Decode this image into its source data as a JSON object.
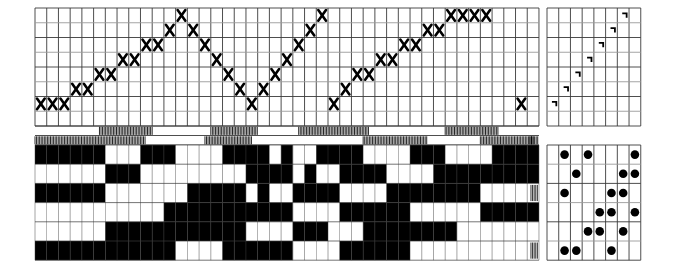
{
  "document": {
    "type": "weaving-draft",
    "title": "Weaving draft (threading, tie-up, treadling and drawdown)",
    "background_color": "#ffffff",
    "grid_line_color": "#3a3a3a",
    "grid_line_color_light": "#9a9a9a",
    "mark_color": "#000000"
  },
  "geometry": {
    "threading_origin_x": 35,
    "threading_origin_y": 8,
    "cell_w": 11.72,
    "threading_cell_h": 14.75,
    "threading_cols": 43,
    "threading_rows": 8,
    "tieup_origin_x": 547,
    "tieup_cols": 8,
    "hatch_band_y": 126,
    "hatch_band_rows": 2,
    "hatch_band_h": 9.5,
    "drawdown_origin_y": 145,
    "drawdown_rows": 6,
    "drawdown_cell_h": 19.2,
    "pedal_origin_x": 547,
    "pedal_cols": 8
  },
  "threading": {
    "label": "threading-draft",
    "symbol": "X",
    "note": "shaft index counted from bottom row = 0",
    "columns": [
      {
        "col": 0,
        "row_from_bottom": 1
      },
      {
        "col": 1,
        "row_from_bottom": 1
      },
      {
        "col": 2,
        "row_from_bottom": 1
      },
      {
        "col": 3,
        "row_from_bottom": 2
      },
      {
        "col": 4,
        "row_from_bottom": 2
      },
      {
        "col": 5,
        "row_from_bottom": 3
      },
      {
        "col": 6,
        "row_from_bottom": 3
      },
      {
        "col": 7,
        "row_from_bottom": 4
      },
      {
        "col": 8,
        "row_from_bottom": 4
      },
      {
        "col": 9,
        "row_from_bottom": 5
      },
      {
        "col": 10,
        "row_from_bottom": 5
      },
      {
        "col": 11,
        "row_from_bottom": 6
      },
      {
        "col": 12,
        "row_from_bottom": 7
      },
      {
        "col": 13,
        "row_from_bottom": 6
      },
      {
        "col": 14,
        "row_from_bottom": 5
      },
      {
        "col": 15,
        "row_from_bottom": 4
      },
      {
        "col": 16,
        "row_from_bottom": 3
      },
      {
        "col": 17,
        "row_from_bottom": 2
      },
      {
        "col": 18,
        "row_from_bottom": 1
      },
      {
        "col": 19,
        "row_from_bottom": 2
      },
      {
        "col": 20,
        "row_from_bottom": 3
      },
      {
        "col": 21,
        "row_from_bottom": 4
      },
      {
        "col": 22,
        "row_from_bottom": 5
      },
      {
        "col": 23,
        "row_from_bottom": 6
      },
      {
        "col": 24,
        "row_from_bottom": 7
      },
      {
        "col": 25,
        "row_from_bottom": 1
      },
      {
        "col": 26,
        "row_from_bottom": 2
      },
      {
        "col": 27,
        "row_from_bottom": 3
      },
      {
        "col": 28,
        "row_from_bottom": 3
      },
      {
        "col": 29,
        "row_from_bottom": 4
      },
      {
        "col": 30,
        "row_from_bottom": 4
      },
      {
        "col": 31,
        "row_from_bottom": 5
      },
      {
        "col": 32,
        "row_from_bottom": 5
      },
      {
        "col": 33,
        "row_from_bottom": 6
      },
      {
        "col": 34,
        "row_from_bottom": 6
      },
      {
        "col": 35,
        "row_from_bottom": 7
      },
      {
        "col": 36,
        "row_from_bottom": 7
      },
      {
        "col": 37,
        "row_from_bottom": 7
      },
      {
        "col": 38,
        "row_from_bottom": 7
      },
      {
        "col": 41,
        "row_from_bottom": 1
      }
    ]
  },
  "tieup": {
    "label": "tie-up-grid",
    "symbol": "corner-hook",
    "cells": [
      {
        "col": 0,
        "row_from_bottom": 1
      },
      {
        "col": 1,
        "row_from_bottom": 2
      },
      {
        "col": 2,
        "row_from_bottom": 3
      },
      {
        "col": 3,
        "row_from_bottom": 4
      },
      {
        "col": 4,
        "row_from_bottom": 5
      },
      {
        "col": 5,
        "row_from_bottom": 6
      },
      {
        "col": 6,
        "row_from_bottom": 7
      }
    ]
  },
  "treadling": {
    "label": "treadling-pedals",
    "symbol": "dot",
    "rows": [
      {
        "row": 0,
        "cols": [
          1,
          3,
          7
        ]
      },
      {
        "row": 1,
        "cols": [
          2,
          6,
          7
        ]
      },
      {
        "row": 2,
        "cols": [
          1,
          5,
          6
        ]
      },
      {
        "row": 3,
        "cols": [
          4,
          5,
          7
        ]
      },
      {
        "row": 4,
        "cols": [
          3,
          4,
          6
        ]
      },
      {
        "row": 5,
        "cols": [
          1,
          2,
          5
        ]
      }
    ]
  },
  "hatch_band": {
    "label": "warp-float-hatch-band",
    "upper_runs": [
      [
        11,
        20
      ],
      [
        30,
        38
      ],
      [
        45,
        57
      ],
      [
        70,
        79
      ]
    ],
    "lower_runs": [
      [
        0,
        19
      ],
      [
        29,
        37
      ],
      [
        56,
        67
      ],
      [
        76,
        85
      ]
    ]
  },
  "drawdown": {
    "label": "drawdown-interlacement",
    "cols": 43,
    "rows": 6,
    "note": "1 = black (warp up), 0 = white (weft up); row 0 is top",
    "matrix": [
      [
        1,
        1,
        1,
        1,
        1,
        1,
        0,
        0,
        0,
        1,
        1,
        1,
        0,
        0,
        0,
        0,
        1,
        1,
        1,
        1,
        0,
        1,
        0,
        0,
        1,
        1,
        1,
        1,
        0,
        0,
        0,
        0,
        1,
        1,
        1,
        0,
        0,
        0,
        0,
        1,
        1,
        1,
        1
      ],
      [
        0,
        0,
        0,
        0,
        0,
        0,
        1,
        1,
        1,
        0,
        0,
        0,
        0,
        0,
        0,
        0,
        0,
        0,
        1,
        1,
        1,
        1,
        0,
        1,
        0,
        0,
        1,
        1,
        1,
        1,
        0,
        0,
        0,
        0,
        1,
        1,
        1,
        1,
        1,
        1,
        1,
        1,
        1
      ],
      [
        1,
        1,
        1,
        1,
        1,
        1,
        0,
        0,
        0,
        0,
        0,
        0,
        0,
        1,
        1,
        1,
        1,
        1,
        0,
        1,
        0,
        0,
        1,
        1,
        1,
        1,
        0,
        0,
        0,
        0,
        1,
        1,
        1,
        1,
        1,
        1,
        1,
        1,
        0,
        0,
        0,
        0,
        0
      ],
      [
        0,
        0,
        0,
        0,
        0,
        0,
        0,
        0,
        0,
        0,
        0,
        1,
        1,
        1,
        1,
        1,
        1,
        1,
        1,
        1,
        1,
        1,
        0,
        0,
        0,
        0,
        1,
        1,
        1,
        1,
        1,
        1,
        0,
        0,
        0,
        0,
        0,
        0,
        1,
        1,
        1,
        1,
        1
      ],
      [
        0,
        0,
        0,
        0,
        0,
        0,
        1,
        1,
        1,
        1,
        1,
        1,
        1,
        1,
        1,
        1,
        1,
        1,
        0,
        0,
        0,
        0,
        1,
        1,
        1,
        0,
        0,
        0,
        1,
        1,
        1,
        1,
        1,
        1,
        1,
        1,
        0,
        0,
        0,
        0,
        0,
        0,
        0
      ],
      [
        1,
        1,
        1,
        1,
        1,
        1,
        1,
        1,
        1,
        1,
        1,
        1,
        0,
        0,
        0,
        0,
        1,
        1,
        1,
        1,
        1,
        1,
        0,
        0,
        0,
        0,
        1,
        1,
        1,
        1,
        1,
        1,
        0,
        0,
        0,
        0,
        0,
        0,
        0,
        0,
        0,
        0,
        0
      ]
    ]
  }
}
